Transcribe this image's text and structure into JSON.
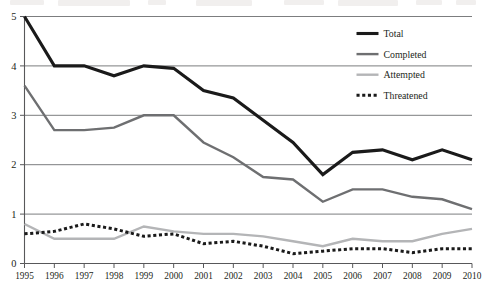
{
  "chart_data": {
    "type": "line",
    "title": "",
    "subtitle": "",
    "xlabel": "",
    "ylabel": "",
    "grid": true,
    "legend_position": "top-right",
    "xlim": [
      1995,
      2010
    ],
    "ylim": [
      0,
      5
    ],
    "yticks": [
      0,
      1,
      2,
      3,
      4,
      5
    ],
    "categories": [
      "1995",
      "1996",
      "1997",
      "1998",
      "1999",
      "2000",
      "2001",
      "2002",
      "2003",
      "2004",
      "2005",
      "2006",
      "2007",
      "2008",
      "2009",
      "2010"
    ],
    "x": [
      1995,
      1996,
      1997,
      1998,
      1999,
      2000,
      2001,
      2002,
      2003,
      2004,
      2005,
      2006,
      2007,
      2008,
      2009,
      2010
    ],
    "series": [
      {
        "name": "Total",
        "color": "#1a1a1a",
        "style": "solid",
        "width": 3.1,
        "values": [
          5.0,
          4.0,
          4.0,
          3.8,
          4.0,
          3.95,
          3.5,
          3.35,
          2.9,
          2.45,
          1.8,
          2.25,
          2.3,
          2.1,
          2.3,
          2.1
        ]
      },
      {
        "name": "Completed",
        "color": "#6e6f71",
        "style": "solid",
        "width": 2.4,
        "values": [
          3.6,
          2.7,
          2.7,
          2.75,
          3.0,
          3.0,
          2.45,
          2.15,
          1.75,
          1.7,
          1.25,
          1.5,
          1.5,
          1.35,
          1.3,
          1.1
        ]
      },
      {
        "name": "Attempted",
        "color": "#b4b5b7",
        "style": "solid",
        "width": 2.4,
        "values": [
          0.8,
          0.5,
          0.5,
          0.5,
          0.75,
          0.65,
          0.6,
          0.6,
          0.55,
          0.45,
          0.35,
          0.5,
          0.45,
          0.45,
          0.6,
          0.7
        ]
      },
      {
        "name": "Threatened",
        "color": "#1a1a1a",
        "style": "dotted",
        "width": 3.0,
        "values": [
          0.6,
          0.65,
          0.8,
          0.7,
          0.55,
          0.6,
          0.4,
          0.45,
          0.35,
          0.2,
          0.25,
          0.3,
          0.3,
          0.22,
          0.3,
          0.3
        ]
      }
    ]
  },
  "legend": {
    "items": [
      {
        "label": "Total",
        "swatch": "thick-black-line",
        "color": "#1a1a1a"
      },
      {
        "label": "Completed",
        "swatch": "medium-gray-line",
        "color": "#6e6f71"
      },
      {
        "label": "Attempted",
        "swatch": "light-gray-line",
        "color": "#b4b5b7"
      },
      {
        "label": "Threatened",
        "swatch": "black-dotted-line",
        "color": "#1a1a1a"
      }
    ]
  }
}
